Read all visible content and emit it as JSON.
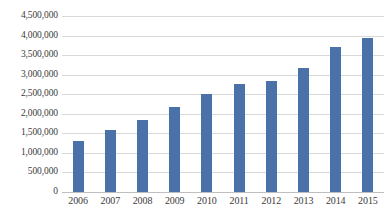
{
  "chart_data": {
    "type": "bar",
    "title": "",
    "subtitle": "",
    "xlabel": "",
    "ylabel": "",
    "categories": [
      "2006",
      "2007",
      "2008",
      "2009",
      "2010",
      "2011",
      "2012",
      "2013",
      "2014",
      "2015"
    ],
    "values": [
      1300000,
      1580000,
      1850000,
      2180000,
      2500000,
      2750000,
      2850000,
      3180000,
      3700000,
      3950000
    ],
    "series": [
      {
        "name": "",
        "values": [
          1300000,
          1580000,
          1850000,
          2180000,
          2500000,
          2750000,
          2850000,
          3180000,
          3700000,
          3950000
        ]
      }
    ],
    "ylim": [
      0,
      4500000
    ],
    "ytick_values": [
      0,
      500000,
      1000000,
      1500000,
      2000000,
      2500000,
      3000000,
      3500000,
      4000000,
      4500000
    ],
    "ytick_labels": [
      "0",
      "500,000",
      "1,000,000",
      "1,500,000",
      "2,000,000",
      "2,500,000",
      "3,000,000",
      "3,500,000",
      "4,000,000",
      "4,500,000"
    ],
    "grid": true,
    "grid_axis": "y",
    "legend": false,
    "legend_position": "none",
    "bar_color": "#4a72a8",
    "gridline_color": "#d9d9d9",
    "axis_color": "#bfbfbf",
    "background_color": "#ffffff",
    "annotations": []
  }
}
